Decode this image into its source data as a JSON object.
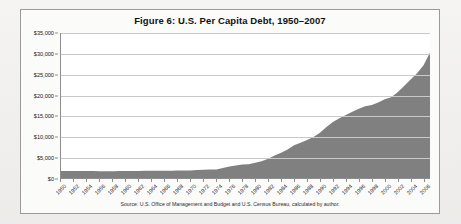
{
  "figure": {
    "title": "Figure 6: U.S. Per Capita Debt, 1950–2007",
    "source": "Source: U.S. Office of Management and Budget and U.S. Census Bureau, calculated by author."
  },
  "colors": {
    "area_fill": "#808080",
    "gridline": "#c9c9c9",
    "axis": "#8d8d8d",
    "page_background": "#efeeec",
    "figure_background": "#fbfbfa",
    "plot_background": "#ffffff",
    "text": "#111111"
  },
  "chart_data": {
    "type": "area",
    "title": "Figure 6: U.S. Per Capita Debt, 1950–2007",
    "xlabel": "",
    "ylabel": "",
    "ylim": [
      0,
      35000
    ],
    "xlim": [
      1950,
      2007
    ],
    "grid": true,
    "legend": null,
    "ytick_labels": [
      "$0",
      "$5,000",
      "$10,000",
      "$15,000",
      "$20,000",
      "$25,000",
      "$30,000",
      "$35,000"
    ],
    "ytick_values": [
      0,
      5000,
      10000,
      15000,
      20000,
      25000,
      30000,
      35000
    ],
    "xtick_labels": [
      "1950",
      "1952",
      "1954",
      "1956",
      "1958",
      "1960",
      "1962",
      "1964",
      "1966",
      "1968",
      "1970",
      "1972",
      "1974",
      "1976",
      "1978",
      "1980",
      "1982",
      "1984",
      "1986",
      "1988",
      "1990",
      "1992",
      "1994",
      "1996",
      "1998",
      "2000",
      "2002",
      "2004",
      "2006"
    ],
    "x": [
      1950,
      1951,
      1952,
      1953,
      1954,
      1955,
      1956,
      1957,
      1958,
      1959,
      1960,
      1961,
      1962,
      1963,
      1964,
      1965,
      1966,
      1967,
      1968,
      1969,
      1970,
      1971,
      1972,
      1973,
      1974,
      1975,
      1976,
      1977,
      1978,
      1979,
      1980,
      1981,
      1982,
      1983,
      1984,
      1985,
      1986,
      1987,
      1988,
      1989,
      1990,
      1991,
      1992,
      1993,
      1994,
      1995,
      1996,
      1997,
      1998,
      1999,
      2000,
      2001,
      2002,
      2003,
      2004,
      2005,
      2006,
      2007
    ],
    "values": [
      1700,
      1690,
      1680,
      1700,
      1720,
      1700,
      1660,
      1620,
      1640,
      1700,
      1680,
      1690,
      1720,
      1740,
      1760,
      1760,
      1740,
      1760,
      1830,
      1790,
      1810,
      1900,
      2010,
      2050,
      2080,
      2400,
      2770,
      3030,
      3230,
      3350,
      3700,
      4050,
      4630,
      5400,
      6100,
      6900,
      7900,
      8500,
      9200,
      9900,
      10900,
      12300,
      13500,
      14400,
      15200,
      16000,
      16700,
      17300,
      17600,
      18200,
      19000,
      19500,
      20700,
      22200,
      23800,
      25300,
      27200,
      30300
    ],
    "series_label": "U.S. per capita debt"
  }
}
